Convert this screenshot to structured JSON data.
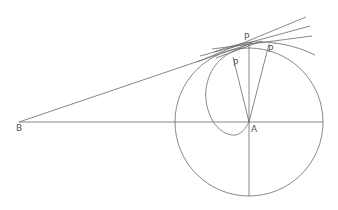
{
  "diagram": {
    "type": "geometric-construction",
    "colors": {
      "stroke": "#6a6a6a",
      "label": "#555555",
      "background": "#ffffff"
    },
    "points": {
      "B": {
        "label": "B",
        "x": 19,
        "y": 122
      },
      "A": {
        "label": "A",
        "x": 249,
        "y": 122
      },
      "P": {
        "label": "P",
        "x": 250,
        "y": 44
      },
      "P1": {
        "label": "P",
        "sup": "′",
        "x": 234,
        "y": 60
      },
      "P2": {
        "label": "P",
        "sup": "″",
        "x": 270,
        "y": 46
      }
    },
    "circle": {
      "cx": 249,
      "cy": 122,
      "r": 74
    }
  }
}
